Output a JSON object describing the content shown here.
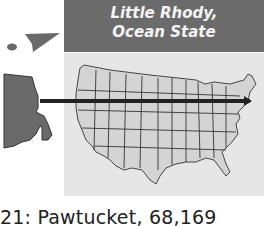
{
  "header": {
    "line1": "Little Rhody,",
    "line2": "Ocean State"
  },
  "caption": "21: Pawtucket, 68,169",
  "colors": {
    "header_bg": "#6b6b6b",
    "header_text": "#f4f4f4",
    "map_bg": "#e6e6e6",
    "state_fill": "#d4d4d4",
    "ri_fill": "#6a6a6a",
    "pointer_line": "#222222"
  },
  "icons": [
    "rhode-island-shape-icon",
    "block-island-icon",
    "us-map-icon",
    "pointer-arrow-icon"
  ]
}
